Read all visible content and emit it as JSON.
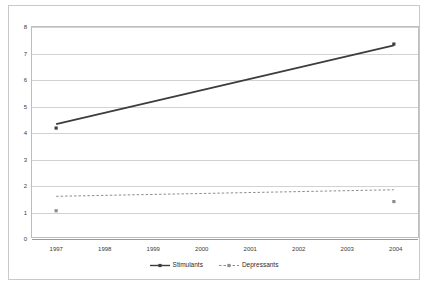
{
  "chart_data": {
    "type": "line",
    "title": "",
    "subtitle": "",
    "xlabel": "",
    "ylabel": "",
    "categories": [
      "1997",
      "1998",
      "1999",
      "2000",
      "2001",
      "2002",
      "2003",
      "2004"
    ],
    "x": [
      1997,
      1998,
      1999,
      2000,
      2001,
      2002,
      2003,
      2004
    ],
    "ylim": [
      0,
      8
    ],
    "yticks": [
      0,
      1,
      2,
      3,
      4,
      5,
      6,
      7,
      8
    ],
    "ytick_labels": [
      "0",
      "1",
      "2",
      "3",
      "4",
      "5",
      "6",
      "7",
      "8"
    ],
    "grid": "horizontal",
    "legend_position": "bottom-center",
    "series": [
      {
        "name": "Stimulants",
        "color": "#3c3c3c",
        "line_style": "solid",
        "marker": "square",
        "endpoints_x": [
          1997,
          2004
        ],
        "marker_values": [
          4.15,
          7.35
        ],
        "trend_values": [
          4.3,
          7.3
        ],
        "values": [
          4.15,
          null,
          null,
          null,
          null,
          null,
          null,
          7.35
        ]
      },
      {
        "name": "Depressants",
        "color": "#8c8c8c",
        "line_style": "dashed",
        "marker": "square",
        "endpoints_x": [
          1997,
          2004
        ],
        "marker_values": [
          1.0,
          1.35
        ],
        "trend_values": [
          1.55,
          1.8
        ],
        "values": [
          1.0,
          null,
          null,
          null,
          null,
          null,
          null,
          1.35
        ]
      }
    ]
  },
  "legend": {
    "entries": [
      {
        "label": "Stimulants"
      },
      {
        "label": "Depressants"
      }
    ]
  }
}
